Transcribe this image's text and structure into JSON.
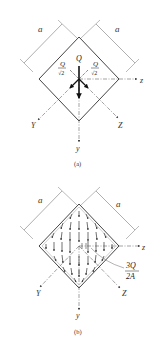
{
  "panels": [
    {
      "id": "a",
      "caption": "(a)",
      "dimension_labels": [
        "a",
        "a"
      ],
      "force_labels": {
        "center": "Q",
        "left_num": "Q",
        "left_den": "√2",
        "right_num": "Q",
        "right_den": "√2"
      },
      "axis_labels": {
        "z": "z",
        "y": "y",
        "Y": "Y",
        "Z": "Z"
      }
    },
    {
      "id": "b",
      "caption": "(b)",
      "dimension_labels": [
        "a",
        "a"
      ],
      "annotation_num": "3Q",
      "annotation_den": "2A",
      "axis_labels": {
        "z": "z",
        "y": "y",
        "Y": "Y",
        "Z": "Z"
      }
    }
  ],
  "colors": {
    "line": "#333333",
    "axis": "#666666",
    "text": "#222222"
  }
}
